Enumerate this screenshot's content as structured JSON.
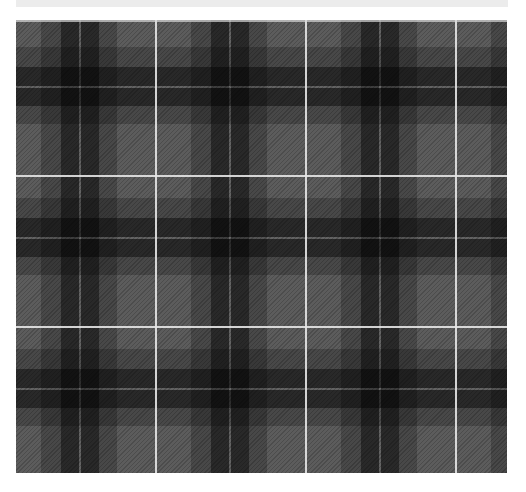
{
  "image": {
    "subject": "tartan-plaid-fabric-pattern",
    "caption_strip": "",
    "colors": {
      "background": "#ffffff",
      "caption_strip": "#ececec",
      "base_gray": "#5c5c5c",
      "mid_band": "#414141",
      "dark_band": "#1e1e1e",
      "intersection": "#0d0d0d",
      "pin_line": "#e8e8e8"
    },
    "pattern": {
      "tile_width_px": 150,
      "tile_height_px": 151,
      "columns_visible": 3.3,
      "rows_visible": 3,
      "white_vertical_lines_x": [
        155,
        305,
        455
      ],
      "white_horizontal_lines_y": [
        176,
        327
      ]
    }
  }
}
